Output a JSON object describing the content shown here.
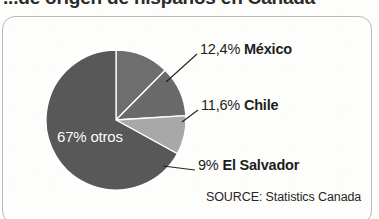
{
  "title": {
    "text": "...de origen de hispanos en Canadá",
    "clipped": true
  },
  "source": {
    "label": "SOURCE: Statistics Canada"
  },
  "interior_label": {
    "text": "67% otros"
  },
  "callouts": [
    {
      "pct": "12,4%",
      "name": "México"
    },
    {
      "pct": "11,6%",
      "name": "Chile"
    },
    {
      "pct": "9%",
      "name": "El Salvador"
    }
  ],
  "colors": {
    "slice_mexico": "#6e6e6e",
    "slice_chile": "#6a6a6a",
    "slice_elsalvador": "#a8a8a8",
    "slice_otros": "#585858",
    "frame_border": "#b9b9b9",
    "leader_line": "#222222",
    "text": "#1d1d1d",
    "interior_text": "#ffffff",
    "page_background": "#fdfdfc"
  },
  "chart_data": {
    "type": "pie",
    "title": "...de origen de hispanos en Canadá",
    "source": "SOURCE: Statistics Canada",
    "labels": [
      "México",
      "Chile",
      "El Salvador",
      "otros"
    ],
    "values": [
      12.4,
      11.6,
      9,
      67
    ],
    "value_labels": [
      "12,4%",
      "11,6%",
      "9%",
      "67%"
    ],
    "units": "percent",
    "total": 100,
    "start_angle_deg": 0,
    "direction": "clockwise",
    "legend": "none",
    "grid": false,
    "slice_colors": [
      "#6e6e6e",
      "#6a6a6a",
      "#a8a8a8",
      "#585858"
    ],
    "label_placement": [
      "callout-right",
      "callout-right",
      "callout-right",
      "inside"
    ]
  }
}
